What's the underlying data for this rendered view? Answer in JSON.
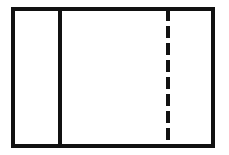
{
  "figure": {
    "canvas": {
      "width": 229,
      "height": 155,
      "background_color": "#ffffff"
    },
    "stroke_color": "#111111",
    "outer_rectangle": {
      "label": "outer rectangle",
      "x": 13,
      "y": 9,
      "width": 200,
      "height": 137,
      "stroke_width": 4,
      "fill": "#ffffff"
    },
    "solid_divider": {
      "label": "solid vertical divider",
      "x": 60,
      "y_start": 9,
      "y_end": 146,
      "stroke_width": 4,
      "style": "solid"
    },
    "dashed_divider": {
      "label": "dashed vertical divider",
      "x": 168,
      "y_start": 9,
      "y_end": 146,
      "stroke_width": 4,
      "style": "dashed",
      "dash_length": 12,
      "gap_length": 5
    },
    "regions": [
      {
        "name": "left-panel",
        "x": 13,
        "width": 47,
        "fill": "#ffffff"
      },
      {
        "name": "center-panel",
        "x": 60,
        "width": 108,
        "fill": "#ffffff"
      },
      {
        "name": "right-panel",
        "x": 168,
        "width": 45,
        "fill": "#ffffff"
      }
    ]
  }
}
